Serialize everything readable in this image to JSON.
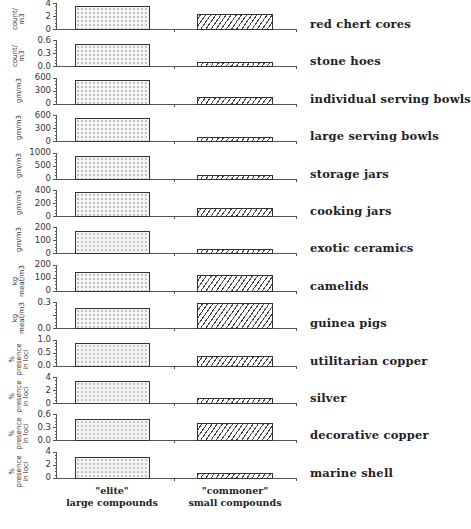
{
  "chart_data": {
    "type": "bar",
    "layout": "small-multiples (13 stacked panels, shared x categories)",
    "categories": [
      "\"elite\" large compounds",
      "\"commoner\" small compounds"
    ],
    "x_group_labels": [
      {
        "line1": "\"elite\"",
        "line2": "large compounds"
      },
      {
        "line1": "\"commoner\"",
        "line2": "small compounds"
      }
    ],
    "series_style": {
      "elite": "stippled (dotted fill)",
      "commoner": "hatched (diagonal lines)"
    },
    "panels": [
      {
        "label": "red chert cores",
        "unit": "count/ m3",
        "ylim": [
          0,
          4
        ],
        "ticks": [
          "4",
          "2",
          "0"
        ],
        "values": [
          3.7,
          2.5
        ]
      },
      {
        "label": "stone hoes",
        "unit": "count/ m3",
        "ylim": [
          0,
          0.6
        ],
        "ticks": [
          "0.6",
          "0.3",
          "0.0"
        ],
        "values": [
          0.55,
          0.13
        ]
      },
      {
        "label": "individual serving bowls",
        "unit": "gm/m3",
        "ylim": [
          0,
          600
        ],
        "ticks": [
          "600",
          "300",
          "0"
        ],
        "values": [
          580,
          190
        ]
      },
      {
        "label": "large serving bowls",
        "unit": "gm/m3",
        "ylim": [
          0,
          600
        ],
        "ticks": [
          "600",
          "300",
          "0"
        ],
        "values": [
          560,
          120
        ]
      },
      {
        "label": "storage jars",
        "unit": "gm/m3",
        "ylim": [
          0,
          1000
        ],
        "ticks": [
          "1000",
          "500",
          "0"
        ],
        "values": [
          900,
          160
        ]
      },
      {
        "label": "cooking jars",
        "unit": "gm/m3",
        "ylim": [
          0,
          400
        ],
        "ticks": [
          "400",
          "200",
          "0"
        ],
        "values": [
          380,
          140
        ]
      },
      {
        "label": "exotic ceramics",
        "unit": "gm/m3",
        "ylim": [
          0,
          200
        ],
        "ticks": [
          "200",
          "100",
          "0"
        ],
        "values": [
          180,
          40
        ]
      },
      {
        "label": "camelids",
        "unit": "kg meat/m3",
        "ylim": [
          0,
          200
        ],
        "ticks": [
          "200",
          "100",
          "0"
        ],
        "values": [
          150,
          130
        ]
      },
      {
        "label": "guinea pigs",
        "unit": "kg meat/m3",
        "ylim": [
          0,
          0.3
        ],
        "ticks": [
          "0.3",
          "",
          "0.0"
        ],
        "values": [
          0.25,
          0.3
        ]
      },
      {
        "label": "utilitarian copper",
        "unit": "% presence in loci",
        "ylim": [
          0,
          1.0
        ],
        "ticks": [
          "1.0",
          "0.5",
          "0.0"
        ],
        "values": [
          0.9,
          0.42
        ]
      },
      {
        "label": "silver",
        "unit": "% presence in loci",
        "ylim": [
          0,
          4
        ],
        "ticks": [
          "4",
          "2",
          "0"
        ],
        "values": [
          3.6,
          0.9
        ]
      },
      {
        "label": "decorative copper",
        "unit": "% presence in loci",
        "ylim": [
          0,
          0.6
        ],
        "ticks": [
          "0.6",
          "0.3",
          "0.0"
        ],
        "values": [
          0.52,
          0.42
        ]
      },
      {
        "label": "marine shell",
        "unit": "% presence in loci",
        "ylim": [
          0,
          4
        ],
        "ticks": [
          "4",
          "2",
          "0"
        ],
        "values": [
          3.3,
          0.9
        ]
      }
    ],
    "title": "",
    "xlabel": "",
    "legend": "none (series identified by x group labels)",
    "grid": false
  }
}
